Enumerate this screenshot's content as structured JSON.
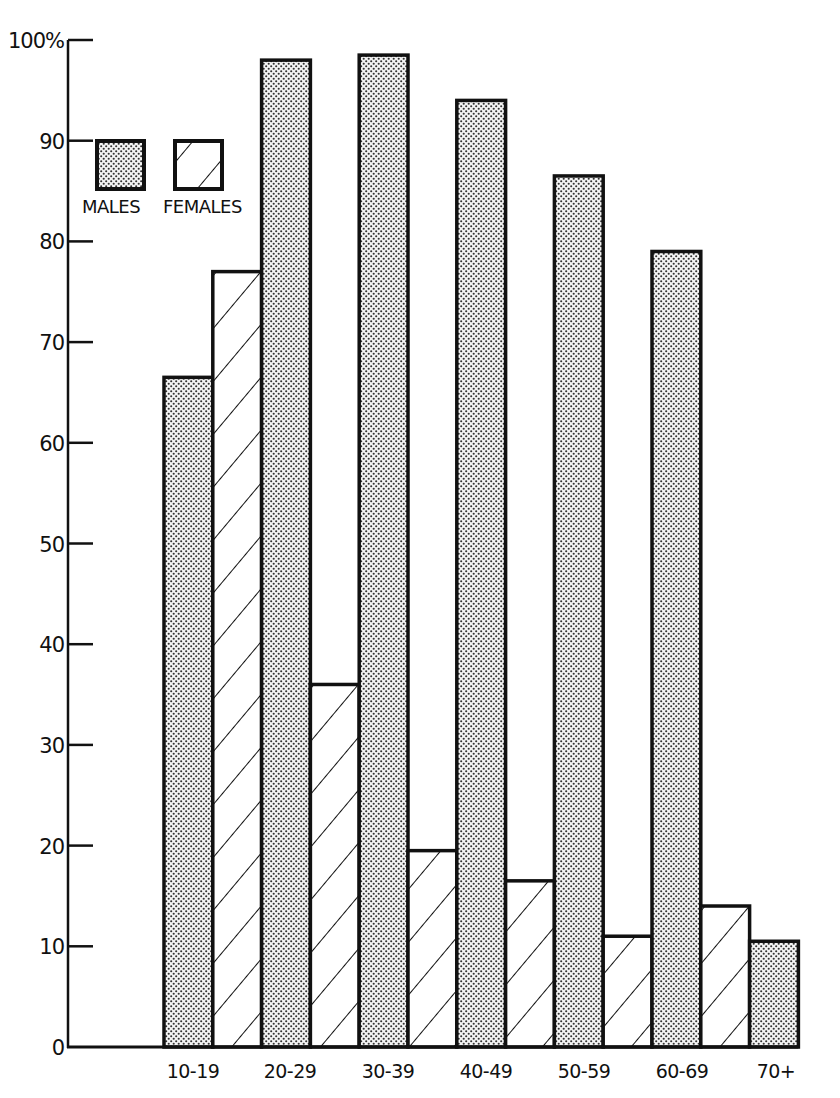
{
  "chart_data": {
    "type": "bar",
    "title": "",
    "xlabel": "",
    "ylabel": "",
    "ylim": [
      0,
      100
    ],
    "y_ticks": [
      "0",
      "10",
      "20",
      "30",
      "40",
      "50",
      "60",
      "70",
      "80",
      "90",
      "100%"
    ],
    "y_tick_values": [
      0,
      10,
      20,
      30,
      40,
      50,
      60,
      70,
      80,
      90,
      100
    ],
    "categories": [
      "10-19",
      "20-29",
      "30-39",
      "40-49",
      "50-59",
      "60-69",
      "70+"
    ],
    "series": [
      {
        "name": "MALES",
        "pattern": "dots",
        "values": [
          66.5,
          98,
          98.5,
          94,
          86.5,
          79,
          10.5
        ]
      },
      {
        "name": "FEMALES",
        "pattern": "diagonal-hatch",
        "values": [
          77,
          36,
          19.5,
          16.5,
          11,
          14,
          null
        ]
      }
    ],
    "grid": false,
    "legend_position": "upper-left-inside",
    "colors": {
      "ink": "#111111",
      "background": "#ffffff",
      "dot_fill": "#f2f2f2"
    }
  },
  "legend": {
    "males_label": "MALES",
    "females_label": "FEMALES"
  }
}
